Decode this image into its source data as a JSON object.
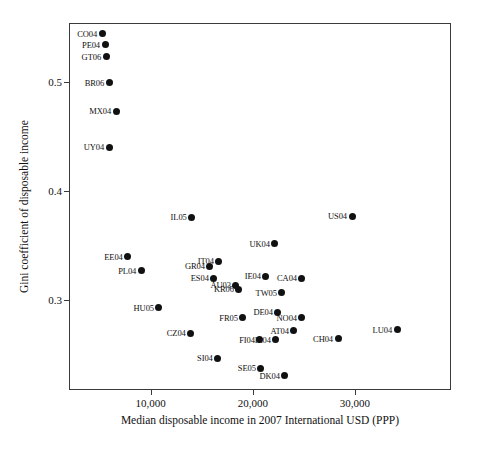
{
  "chart_data": {
    "type": "scatter",
    "title": "",
    "xlabel": "Median disposable income in 2007 International USD (PPP)",
    "ylabel": "Gini coefficient of disposable income",
    "xlim": [
      2000,
      39400
    ],
    "ylim": [
      0.218,
      0.554
    ],
    "xticks": [
      10000,
      20000,
      30000
    ],
    "xticklabels": [
      "10,000",
      "20,000",
      "30,000"
    ],
    "yticks": [
      0.3,
      0.4,
      0.5
    ],
    "yticklabels": [
      "0.3",
      "0.4",
      "0.5"
    ],
    "grid": false,
    "legend": null,
    "marker_color": "#111111",
    "axis_color": "#3a3a3a",
    "background_color": "#ffffff",
    "label_position": "left-of-marker",
    "points": [
      {
        "label": "CO04",
        "x": 5140,
        "y": 0.545
      },
      {
        "label": "PE04",
        "x": 5430,
        "y": 0.535
      },
      {
        "label": "GT06",
        "x": 5530,
        "y": 0.524
      },
      {
        "label": "BR06",
        "x": 5830,
        "y": 0.5
      },
      {
        "label": "MX04",
        "x": 6510,
        "y": 0.474
      },
      {
        "label": "UY04",
        "x": 5830,
        "y": 0.441
      },
      {
        "label": "IL05",
        "x": 13920,
        "y": 0.377
      },
      {
        "label": "US04",
        "x": 29610,
        "y": 0.378
      },
      {
        "label": "UK04",
        "x": 22060,
        "y": 0.353
      },
      {
        "label": "EE04",
        "x": 7650,
        "y": 0.341
      },
      {
        "label": "IT04",
        "x": 16570,
        "y": 0.337
      },
      {
        "label": "GR04",
        "x": 15690,
        "y": 0.332
      },
      {
        "label": "PL04",
        "x": 8970,
        "y": 0.328
      },
      {
        "label": "ES04",
        "x": 16080,
        "y": 0.321
      },
      {
        "label": "IE04",
        "x": 21180,
        "y": 0.323
      },
      {
        "label": "CA04",
        "x": 24710,
        "y": 0.321
      },
      {
        "label": "AU03",
        "x": 18240,
        "y": 0.315
      },
      {
        "label": "KR06",
        "x": 18530,
        "y": 0.311
      },
      {
        "label": "TW05",
        "x": 22750,
        "y": 0.308
      },
      {
        "label": "HU05",
        "x": 10710,
        "y": 0.294
      },
      {
        "label": "DE04",
        "x": 22350,
        "y": 0.29
      },
      {
        "label": "FR05",
        "x": 18920,
        "y": 0.285
      },
      {
        "label": "NO04",
        "x": 24710,
        "y": 0.285
      },
      {
        "label": "CZ04",
        "x": 13820,
        "y": 0.271
      },
      {
        "label": "AT04",
        "x": 23920,
        "y": 0.273
      },
      {
        "label": "LU04",
        "x": 34020,
        "y": 0.274
      },
      {
        "label": "FI04",
        "x": 20590,
        "y": 0.265
      },
      {
        "label": "IL04",
        "x": 22160,
        "y": 0.265
      },
      {
        "label": "CH04",
        "x": 28240,
        "y": 0.266
      },
      {
        "label": "SI04",
        "x": 16470,
        "y": 0.248
      },
      {
        "label": "SE05",
        "x": 20690,
        "y": 0.239
      },
      {
        "label": "DK04",
        "x": 23040,
        "y": 0.232
      }
    ]
  }
}
